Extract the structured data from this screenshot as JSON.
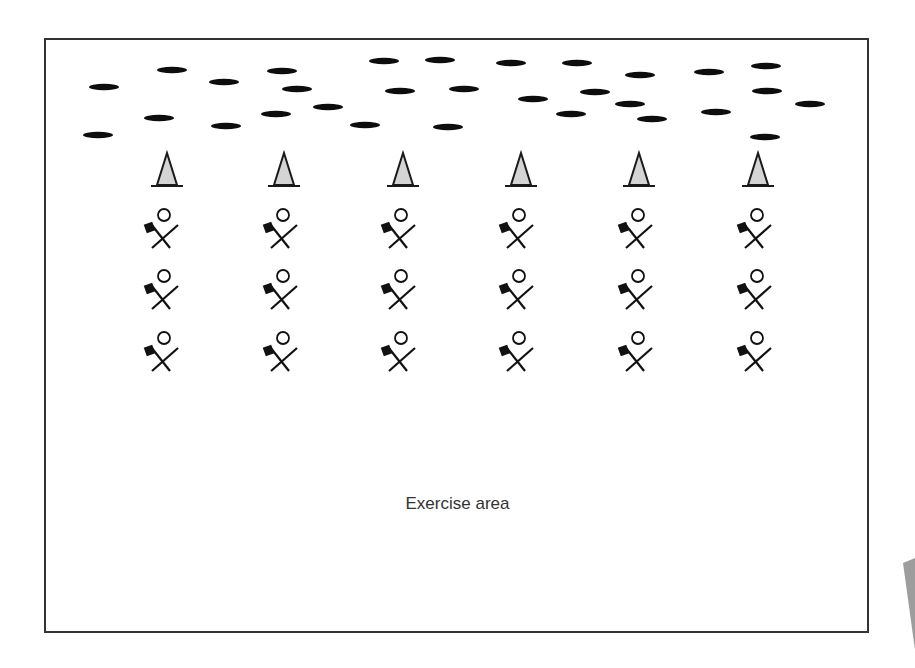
{
  "diagram": {
    "caption": "Exercise area",
    "colors": {
      "frame": "#333333",
      "ellipse": "#111111",
      "cone_fill": "#d4d4d4",
      "cone_stroke": "#1a1a1a",
      "person": "#111111",
      "corner_wedge": "#8c8c8c",
      "caption": "#333333"
    },
    "ellipses": [
      [
        104,
        87
      ],
      [
        98,
        135
      ],
      [
        172,
        70
      ],
      [
        159,
        118
      ],
      [
        224,
        82
      ],
      [
        226,
        126
      ],
      [
        282,
        71
      ],
      [
        297,
        89
      ],
      [
        276,
        114
      ],
      [
        328,
        107
      ],
      [
        365,
        125
      ],
      [
        384,
        61
      ],
      [
        400,
        91
      ],
      [
        440,
        60
      ],
      [
        448,
        127
      ],
      [
        464,
        89
      ],
      [
        511,
        63
      ],
      [
        533,
        99
      ],
      [
        571,
        114
      ],
      [
        577,
        63
      ],
      [
        595,
        92
      ],
      [
        630,
        104
      ],
      [
        640,
        75
      ],
      [
        652,
        119
      ],
      [
        709,
        72
      ],
      [
        716,
        112
      ],
      [
        766,
        66
      ],
      [
        767,
        91
      ],
      [
        765,
        137
      ],
      [
        810,
        104
      ]
    ],
    "cones": [
      167,
      284,
      403,
      521,
      639,
      758
    ],
    "people": {
      "columns": [
        164,
        283,
        401,
        519,
        638,
        757
      ],
      "rows": [
        215,
        276,
        338
      ]
    },
    "icons": {
      "ellipse": "marker-disc-icon",
      "cone": "cone-icon",
      "person": "person-with-flag-icon"
    }
  }
}
